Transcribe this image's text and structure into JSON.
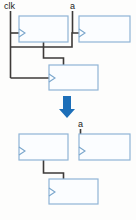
{
  "figure": {
    "kind": "digital-logic-block-diagram",
    "caption_top": "circuit before transformation",
    "caption_bottom": "circuit after transformation",
    "background_color": "#fdfdfc"
  },
  "colors": {
    "block_fill": "#fbfdff",
    "block_stroke": "#8fb4d6",
    "wire": "#3d3a38",
    "arrow": "#1d6fb8",
    "label_text": "#1a1a1a"
  },
  "signals": {
    "clk": {
      "label": "clk",
      "x": 4,
      "y": 9
    },
    "a_top": {
      "label": "a",
      "x": 70,
      "y": 9
    },
    "a_bottom": {
      "label": "a",
      "x": 78,
      "y": 127
    }
  },
  "top_diagram": {
    "name": "before",
    "blocks": [
      {
        "id": "ff1",
        "x": 19,
        "y": 16,
        "w": 49,
        "h": 26,
        "clock_marker": true
      },
      {
        "id": "ff2",
        "x": 79,
        "y": 16,
        "w": 51,
        "h": 26,
        "clock_marker": true
      },
      {
        "id": "ff3",
        "x": 49,
        "y": 65,
        "w": 49,
        "h": 25,
        "clock_marker": true
      }
    ],
    "wires": [
      "clk-trunk-vertical",
      "clk-to-ff1-clock",
      "clk-to-ff2-clock",
      "clk-to-ff3-clock",
      "a-to-ff2-clock",
      "ff1-out-to-ff3-in"
    ]
  },
  "transform_arrow": {
    "name": "transformation-arrow",
    "direction": "down",
    "x": 62,
    "y": 96,
    "w": 10,
    "h": 22,
    "color": "#1d6fb8"
  },
  "bottom_diagram": {
    "name": "after",
    "blocks": [
      {
        "id": "ff1b",
        "x": 19,
        "y": 134,
        "w": 49,
        "h": 26,
        "clock_marker": true
      },
      {
        "id": "ff2b",
        "x": 79,
        "y": 134,
        "w": 51,
        "h": 26,
        "clock_marker": true
      },
      {
        "id": "ff3b",
        "x": 49,
        "y": 179,
        "w": 49,
        "h": 25,
        "clock_marker": true
      }
    ],
    "wires": [
      "a-to-ff2b-clock",
      "ff1b-out-to-ff3b-in"
    ]
  }
}
